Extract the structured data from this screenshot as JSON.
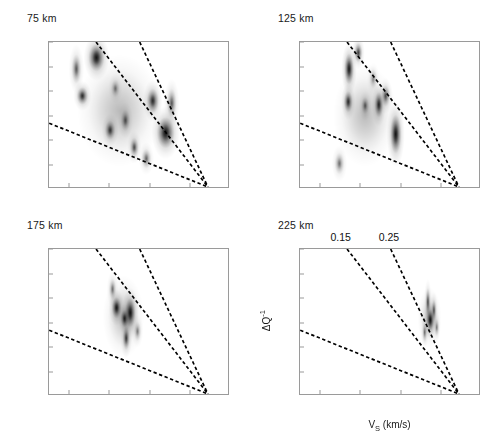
{
  "figure": {
    "xlabel_main": "V",
    "xlabel_sub": "S",
    "xlabel_unit": " (km/s)",
    "ylabel_main": "ΔQ",
    "ylabel_sup": "-1"
  },
  "chart_data": {
    "type": "heatmap",
    "title": "",
    "xlabel": "Vs (km/s)",
    "ylabel": "ΔQ^-1",
    "xlim": [
      4.25,
      4.7
    ],
    "ylim": [
      -0.015,
      0.015
    ],
    "xticks": [
      4.3,
      4.4,
      4.5,
      4.6,
      4.7
    ],
    "xtick_labels": [
      "4.3",
      "4.4",
      "4.5",
      "4.6",
      "4.7"
    ],
    "yticks": [
      0.015,
      0.01,
      0.005,
      0,
      -0.005,
      -0.01,
      -0.015
    ],
    "ytick_labels": [
      "0.015",
      "0.01",
      "0.005",
      "0",
      "-0.005",
      "-0.01",
      "-0.015"
    ],
    "grid": false,
    "legend": "none",
    "colormap": "grayscale-inverted",
    "contour_lines": [
      {
        "label": "0.05",
        "from": [
          4.25,
          -0.0018
        ],
        "to": [
          4.65,
          -0.015
        ]
      },
      {
        "label": "0.15",
        "from": [
          4.368,
          0.015
        ],
        "to": [
          4.65,
          -0.015
        ]
      },
      {
        "label": "0.25",
        "from": [
          4.478,
          0.015
        ],
        "to": [
          4.65,
          -0.015
        ]
      }
    ],
    "contour_labels_shown_on_panel": "225 km",
    "panels": [
      {
        "title": "75 km",
        "depth_km": 75,
        "show_contour_labels": false,
        "show_axis_labels": false,
        "cloud": {
          "cx": 4.425,
          "cy": 0.001,
          "rx": 0.105,
          "ry": 0.0115
        },
        "blobs": [
          {
            "x": 4.368,
            "y": 0.0118,
            "r": 0.02,
            "ry": 0.0028,
            "i": 1.0
          },
          {
            "x": 4.333,
            "y": 0.004,
            "r": 0.014,
            "ry": 0.0018,
            "i": 0.8
          },
          {
            "x": 4.318,
            "y": 0.0095,
            "r": 0.012,
            "ry": 0.003,
            "i": 0.55
          },
          {
            "x": 4.402,
            "y": -0.003,
            "r": 0.013,
            "ry": 0.002,
            "i": 0.72
          },
          {
            "x": 4.44,
            "y": -0.001,
            "r": 0.012,
            "ry": 0.0022,
            "i": 0.55
          },
          {
            "x": 4.462,
            "y": -0.0065,
            "r": 0.011,
            "ry": 0.002,
            "i": 0.6
          },
          {
            "x": 4.508,
            "y": 0.003,
            "r": 0.015,
            "ry": 0.0025,
            "i": 0.8
          },
          {
            "x": 4.54,
            "y": -0.0035,
            "r": 0.022,
            "ry": 0.0032,
            "i": 1.0
          },
          {
            "x": 4.555,
            "y": 0.0025,
            "r": 0.012,
            "ry": 0.003,
            "i": 0.55
          },
          {
            "x": 4.492,
            "y": -0.0088,
            "r": 0.012,
            "ry": 0.002,
            "i": 0.5
          },
          {
            "x": 4.415,
            "y": 0.0055,
            "r": 0.011,
            "ry": 0.0018,
            "i": 0.4
          }
        ]
      },
      {
        "title": "125 km",
        "depth_km": 125,
        "show_contour_labels": false,
        "show_axis_labels": false,
        "cloud": {
          "cx": 4.412,
          "cy": 0.0,
          "rx": 0.08,
          "ry": 0.0105
        },
        "blobs": [
          {
            "x": 4.372,
            "y": 0.0095,
            "r": 0.012,
            "ry": 0.0032,
            "i": 0.95
          },
          {
            "x": 4.395,
            "y": 0.0128,
            "r": 0.01,
            "ry": 0.002,
            "i": 0.7
          },
          {
            "x": 4.37,
            "y": 0.0028,
            "r": 0.011,
            "ry": 0.0022,
            "i": 0.8
          },
          {
            "x": 4.412,
            "y": 0.002,
            "r": 0.01,
            "ry": 0.0018,
            "i": 0.5
          },
          {
            "x": 4.446,
            "y": 0.0022,
            "r": 0.011,
            "ry": 0.0026,
            "i": 0.85
          },
          {
            "x": 4.463,
            "y": 0.004,
            "r": 0.011,
            "ry": 0.0022,
            "i": 0.6
          },
          {
            "x": 4.488,
            "y": -0.0038,
            "r": 0.014,
            "ry": 0.004,
            "i": 1.0
          },
          {
            "x": 4.348,
            "y": -0.0098,
            "r": 0.012,
            "ry": 0.0022,
            "i": 0.45
          },
          {
            "x": 4.432,
            "y": 0.0075,
            "r": 0.01,
            "ry": 0.002,
            "i": 0.35
          }
        ]
      },
      {
        "title": "175 km",
        "depth_km": 175,
        "show_contour_labels": false,
        "show_axis_labels": false,
        "cloud": {
          "cx": 4.435,
          "cy": 0.0012,
          "rx": 0.052,
          "ry": 0.0085
        },
        "blobs": [
          {
            "x": 4.418,
            "y": 0.003,
            "r": 0.012,
            "ry": 0.0022,
            "i": 0.95
          },
          {
            "x": 4.452,
            "y": 0.002,
            "r": 0.013,
            "ry": 0.003,
            "i": 1.0
          },
          {
            "x": 4.438,
            "y": 0.0008,
            "r": 0.01,
            "ry": 0.0018,
            "i": 0.85
          },
          {
            "x": 4.442,
            "y": -0.0032,
            "r": 0.009,
            "ry": 0.0024,
            "i": 0.7
          },
          {
            "x": 4.408,
            "y": 0.0068,
            "r": 0.009,
            "ry": 0.0022,
            "i": 0.45
          },
          {
            "x": 4.47,
            "y": -0.0018,
            "r": 0.009,
            "ry": 0.002,
            "i": 0.4
          }
        ]
      },
      {
        "title": "225 km",
        "depth_km": 225,
        "show_contour_labels": true,
        "show_axis_labels": true,
        "cloud": {
          "cx": 4.572,
          "cy": 0.001,
          "rx": 0.03,
          "ry": 0.0062
        },
        "blobs": [
          {
            "x": 4.574,
            "y": 0.0005,
            "r": 0.009,
            "ry": 0.0022,
            "i": 1.0
          },
          {
            "x": 4.568,
            "y": 0.0042,
            "r": 0.006,
            "ry": 0.0028,
            "i": 0.6
          },
          {
            "x": 4.583,
            "y": 0.0025,
            "r": 0.006,
            "ry": 0.0022,
            "i": 0.55
          },
          {
            "x": 4.56,
            "y": -0.002,
            "r": 0.006,
            "ry": 0.002,
            "i": 0.45
          },
          {
            "x": 4.59,
            "y": -0.001,
            "r": 0.006,
            "ry": 0.0018,
            "i": 0.4
          }
        ]
      }
    ]
  }
}
